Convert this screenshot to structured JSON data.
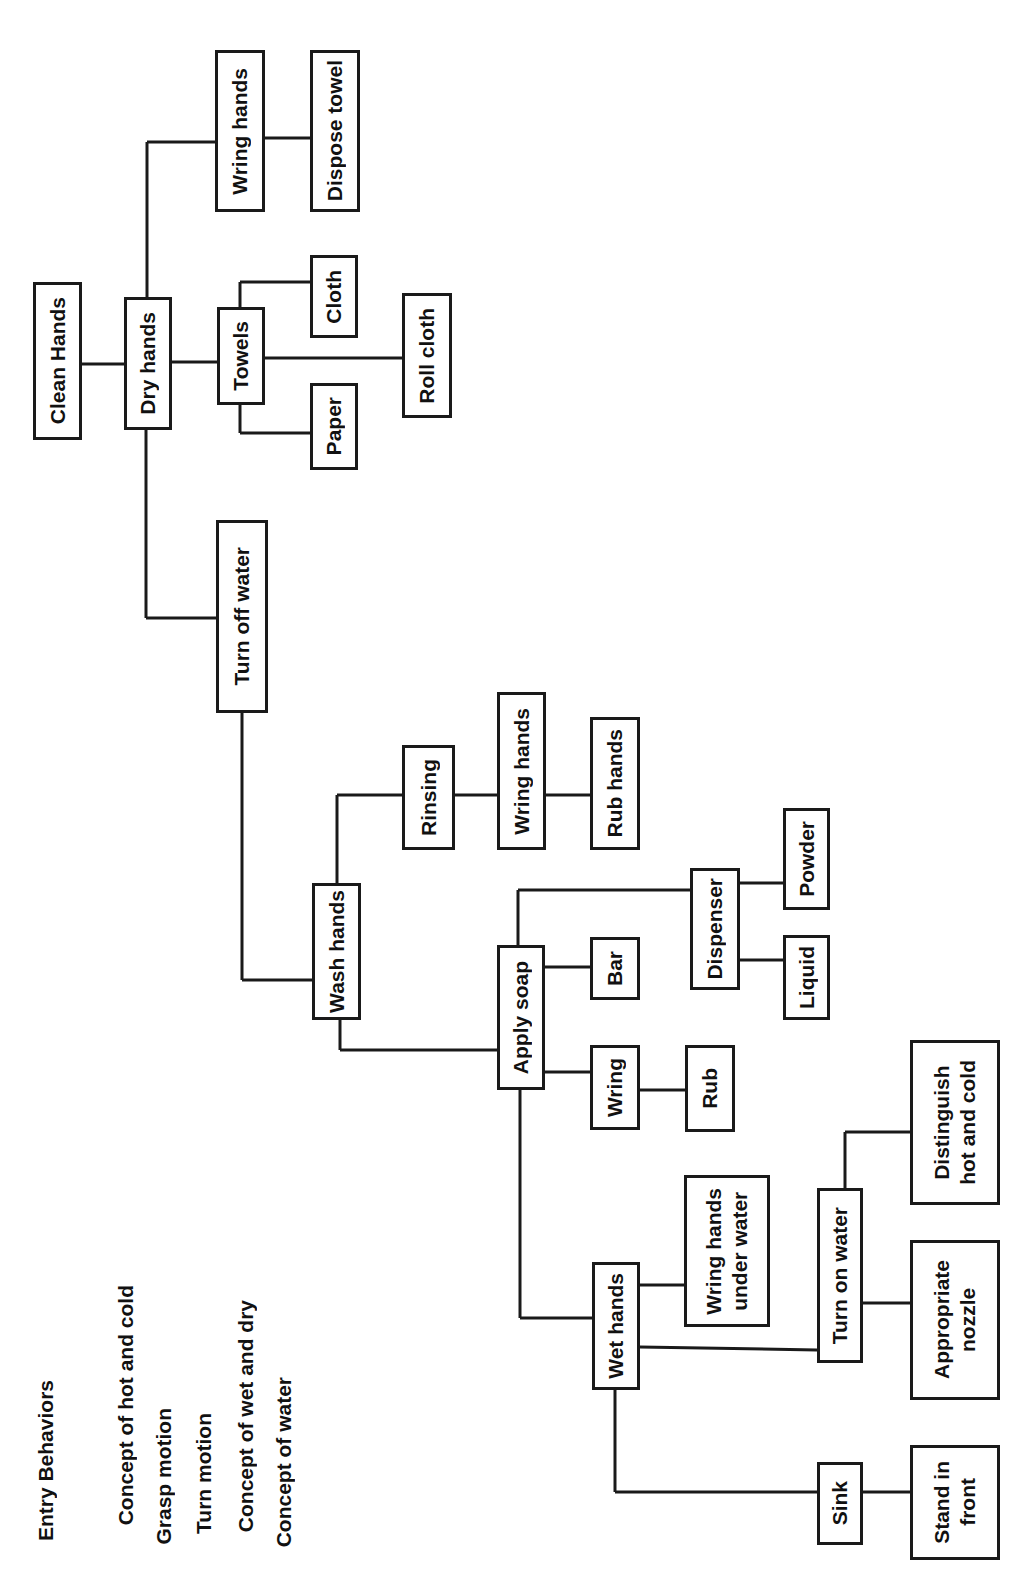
{
  "diagram": {
    "title": "Clean Hands",
    "entry_behaviors": {
      "heading": "Entry Behaviors",
      "items": [
        "Concept of hot and cold",
        "Grasp motion",
        "Turn motion",
        "Concept of wet and dry",
        "Concept of water"
      ]
    },
    "nodes": {
      "clean_hands": "Clean Hands",
      "dry_hands": "Dry hands",
      "wring_hands_dry": "Wring hands",
      "dispose_towel": "Dispose towel",
      "towels": "Towels",
      "cloth": "Cloth",
      "paper": "Paper",
      "roll_cloth": "Roll cloth",
      "turn_off_water": "Turn off water",
      "wash_hands": "Wash hands",
      "rinsing": "Rinsing",
      "wring_hands_rinse": "Wring hands",
      "rub_hands": "Rub hands",
      "apply_soap": "Apply soap",
      "bar": "Bar",
      "dispenser": "Dispenser",
      "powder": "Powder",
      "liquid": "Liquid",
      "wring": "Wring",
      "rub": "Rub",
      "wet_hands": "Wet hands",
      "wring_hands_under_water": "Wring hands\nunder water",
      "turn_on_water": "Turn on water",
      "distinguish_hot_cold": "Distinguish\nhot and cold",
      "appropriate_nozzle": "Appropriate\nnozzle",
      "sink": "Sink",
      "stand_in_front": "Stand in\nfront"
    },
    "edges": [
      [
        "clean_hands",
        "dry_hands"
      ],
      [
        "dry_hands",
        "wring_hands_dry"
      ],
      [
        "wring_hands_dry",
        "dispose_towel"
      ],
      [
        "dry_hands",
        "towels"
      ],
      [
        "towels",
        "cloth"
      ],
      [
        "towels",
        "paper"
      ],
      [
        "towels",
        "roll_cloth"
      ],
      [
        "dry_hands",
        "turn_off_water"
      ],
      [
        "turn_off_water",
        "wash_hands"
      ],
      [
        "wash_hands",
        "rinsing"
      ],
      [
        "rinsing",
        "wring_hands_rinse"
      ],
      [
        "wring_hands_rinse",
        "rub_hands"
      ],
      [
        "wash_hands",
        "apply_soap"
      ],
      [
        "apply_soap",
        "bar"
      ],
      [
        "apply_soap",
        "dispenser"
      ],
      [
        "dispenser",
        "powder"
      ],
      [
        "dispenser",
        "liquid"
      ],
      [
        "apply_soap",
        "wring"
      ],
      [
        "wring",
        "rub"
      ],
      [
        "apply_soap",
        "wet_hands"
      ],
      [
        "wet_hands",
        "wring_hands_under_water"
      ],
      [
        "wet_hands",
        "turn_on_water"
      ],
      [
        "turn_on_water",
        "distinguish_hot_cold"
      ],
      [
        "turn_on_water",
        "appropriate_nozzle"
      ],
      [
        "wet_hands",
        "sink"
      ],
      [
        "sink",
        "stand_in_front"
      ]
    ],
    "colors": {
      "line": "#1a1a1a",
      "background": "#ffffff"
    }
  }
}
